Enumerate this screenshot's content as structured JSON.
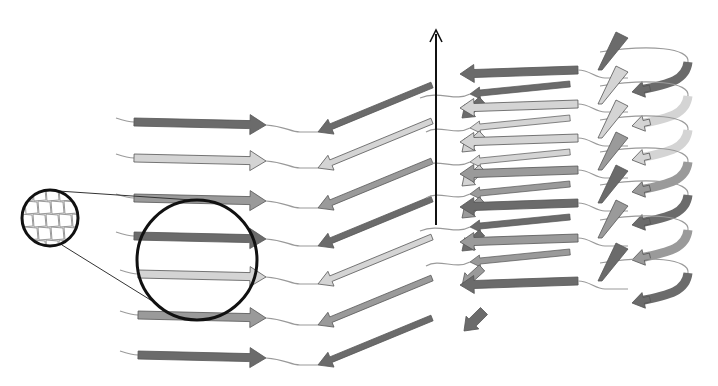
{
  "diagram": {
    "title": "",
    "colors": {
      "dark": "#6b6b6b",
      "mid": "#9a9a9a",
      "light": "#d4d4d4",
      "outline": "#555555",
      "loop": "#9a9a9a",
      "axis": "#111111",
      "lens": "#111111"
    },
    "left_sheet": {
      "rows": [
        {
          "y": 122,
          "shade": "dark"
        },
        {
          "y": 158,
          "shade": "light"
        },
        {
          "y": 198,
          "shade": "mid"
        },
        {
          "y": 236,
          "shade": "dark"
        },
        {
          "y": 274,
          "shade": "light"
        },
        {
          "y": 315,
          "shade": "mid"
        },
        {
          "y": 355,
          "shade": "dark"
        }
      ]
    },
    "right_stack": {
      "layers": [
        {
          "y": 72,
          "shade": "dark"
        },
        {
          "y": 106,
          "shade": "light"
        },
        {
          "y": 140,
          "shade": "light"
        },
        {
          "y": 172,
          "shade": "mid"
        },
        {
          "y": 205,
          "shade": "dark"
        },
        {
          "y": 240,
          "shade": "mid"
        },
        {
          "y": 283,
          "shade": "dark"
        }
      ]
    },
    "axis": {
      "x": 436,
      "y_top": 30,
      "y_bottom": 225
    },
    "inset": {
      "small_circle": {
        "cx": 50,
        "cy": 218,
        "r": 28
      },
      "large_circle": {
        "cx": 197,
        "cy": 260,
        "r": 60
      }
    }
  }
}
